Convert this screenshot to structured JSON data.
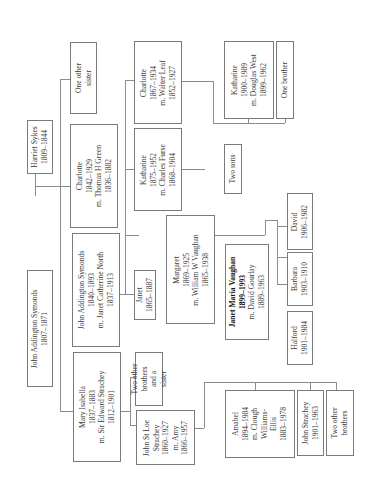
{
  "people": {
    "jas_sr": {
      "lines": [
        "John Addington Symonds",
        "1807–1871"
      ]
    },
    "harriet": {
      "lines": [
        "Harriet Sykes",
        "1809–1844"
      ]
    },
    "mary": {
      "lines": [
        "Mary Isabella",
        "1837–1883",
        "m. Sir Edward Strachey",
        "1812–1901"
      ]
    },
    "jas_jr": {
      "lines": [
        "John Addington Symonds",
        "1840–1893",
        "m. Janet Catherine North",
        "1837–1913"
      ]
    },
    "charlotte_sr": {
      "lines": [
        "Charlotte",
        "1842–1929",
        "m. Thomas H Green",
        "1836–1882"
      ]
    },
    "other_sister": {
      "lines": [
        "One other",
        "sister"
      ]
    },
    "two_other_brothers_sister": {
      "lines": [
        "Two other",
        "brothers",
        "and a",
        "sister"
      ]
    },
    "john_st_loe": {
      "lines": [
        "John St Loe",
        "Strachey",
        "1860–1927",
        "m. Amy",
        "1866–1957"
      ]
    },
    "janet": {
      "lines": [
        "Janet",
        "1865–1887"
      ]
    },
    "margaret": {
      "lines": [
        "Margaret",
        "1869–1925",
        "m. William W Vaughan",
        "1865–1938"
      ]
    },
    "katharine_furse": {
      "lines": [
        "Katharine",
        "1875–1952",
        "m. Charles Furse",
        "1868–1904"
      ]
    },
    "charlotte_leaf": {
      "lines": [
        "Charlotte",
        "1867–1934",
        "m. Walter Leaf",
        "1852–1927"
      ]
    },
    "two_sons": {
      "lines": [
        "Two sons"
      ]
    },
    "katharine_west": {
      "lines": [
        "Katharine",
        "1900–1989",
        "m. Douglas West",
        "1899–1962"
      ]
    },
    "one_brother": {
      "lines": [
        "One brother"
      ]
    },
    "janet_maria": {
      "lines": [
        "Janet Maria Vaughan",
        "1899–1993",
        "m. David Gourlay",
        "1889–1963"
      ]
    },
    "david": {
      "lines": [
        "David",
        "1906–1982"
      ]
    },
    "barbara": {
      "lines": [
        "Barbara",
        "1903–1910"
      ]
    },
    "halford": {
      "lines": [
        "Halford",
        "1901–1984"
      ]
    },
    "amabel": {
      "lines": [
        "Amabel",
        "1894–1984",
        "m. Clough",
        "Williams-",
        "Ellis",
        "1883–1978"
      ]
    },
    "john_strachey": {
      "lines": [
        "John Strachey",
        "1901–1963"
      ]
    },
    "two_other_brothers": {
      "lines": [
        "Two other",
        "brothers"
      ]
    }
  }
}
